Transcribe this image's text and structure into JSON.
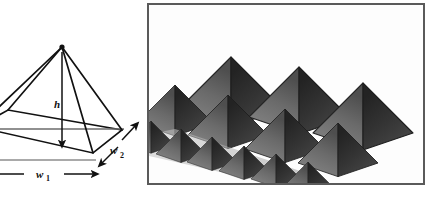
{
  "figure": {
    "kind": "two-panel-illustration",
    "width": 438,
    "height": 197,
    "background_color": "#ffffff"
  },
  "left_panel": {
    "name": "pyramid-wireframe-diagram",
    "description": "Line drawing of a square-based pyramid shown in perspective with dimension labels",
    "stroke_color": "#111111",
    "baseline_color": "#6b6b6b",
    "labels": {
      "height": "h",
      "width1_base": "w",
      "width1_sub": "1",
      "width2_base": "w",
      "width2_sub": "2"
    },
    "arrows": [
      {
        "name": "height-arrow",
        "style": "single-headed",
        "direction": "down"
      },
      {
        "name": "w1-arrow",
        "style": "double-headed",
        "direction": "horizontal"
      },
      {
        "name": "w2-arrow",
        "style": "double-headed",
        "direction": "diagonal"
      }
    ]
  },
  "right_panel": {
    "name": "pyramid-array-render",
    "description": "Grayscale shaded 3D render of an array of pyramids arranged in three diagonal rows of increasing size",
    "border_color": "#5a5a5a",
    "background_color": "#fdfdfd",
    "rows": [
      {
        "name": "front-row",
        "count": 6,
        "size": "small"
      },
      {
        "name": "middle-row",
        "count": 4,
        "size": "medium"
      },
      {
        "name": "back-row",
        "count": 3,
        "size": "large"
      }
    ],
    "total_pyramids": 13,
    "shading": {
      "left_face_color": "#6e6e6e",
      "right_face_color": "#3a3a3a",
      "outline_color": "#2a2a2a",
      "ground_color": "#fdfdfd"
    }
  }
}
